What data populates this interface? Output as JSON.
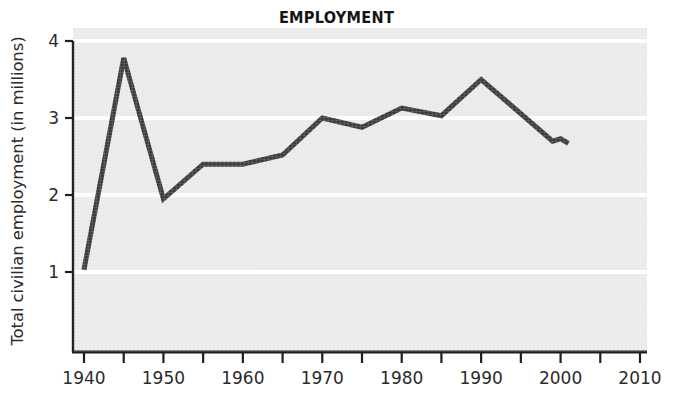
{
  "chart_data": {
    "type": "line",
    "title": "EMPLOYMENT",
    "xlabel": "",
    "ylabel": "Total civilian employment (in millions)",
    "xlim": [
      1938,
      2013
    ],
    "ylim": [
      0,
      4
    ],
    "xticks": [
      1940,
      1950,
      1960,
      1970,
      1980,
      1990,
      2000,
      2010
    ],
    "xtick_labels": [
      "1940",
      "1950",
      "1960",
      "1970",
      "1980",
      "1990",
      "2000",
      "2010"
    ],
    "xminor_ticks": [
      1945,
      1955,
      1965,
      1975,
      1985,
      1995,
      2005
    ],
    "yticks": [
      1,
      2,
      3,
      4
    ],
    "ytick_labels": [
      "1",
      "2",
      "3",
      "4"
    ],
    "grid": "horizontal-white",
    "legend": "none",
    "plot_background": "#ebebeb",
    "line_color": "#3b3b3b",
    "line_width": 5,
    "x": [
      1940,
      1945,
      1950,
      1955,
      1960,
      1965,
      1970,
      1975,
      1980,
      1985,
      1990,
      1999,
      2000,
      2001
    ],
    "values": [
      1.03,
      3.78,
      1.95,
      2.4,
      2.4,
      2.52,
      3.0,
      2.88,
      3.13,
      3.03,
      3.5,
      2.7,
      2.73,
      2.67
    ],
    "series": [
      {
        "name": "Total civilian employment",
        "x": [
          1940,
          1945,
          1950,
          1955,
          1960,
          1965,
          1970,
          1975,
          1980,
          1985,
          1990,
          1999,
          2000,
          2001
        ],
        "values": [
          1.03,
          3.78,
          1.95,
          2.4,
          2.4,
          2.52,
          3.0,
          2.88,
          3.13,
          3.03,
          3.5,
          2.7,
          2.73,
          2.67
        ]
      }
    ]
  },
  "colors": {
    "line": "#3b3b3b",
    "plot_bg": "#ebebeb",
    "gridline": "#ffffff",
    "axis": "#1f1f1f",
    "text": "#2b2b2b"
  }
}
